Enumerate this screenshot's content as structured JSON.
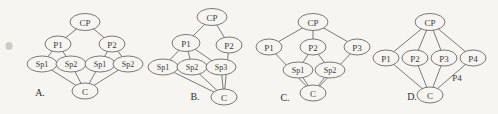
{
  "canvas": {
    "width": 498,
    "height": 114,
    "background": "#f6f5f2",
    "stroke_color": "#6b6b6b",
    "text_color": "#3a3a3a"
  },
  "figure": {
    "type": "diagram",
    "panels": [
      {
        "id": "A",
        "label": "A.",
        "label_x": 40,
        "label_y": 92,
        "nodes": [
          {
            "id": "a-cp",
            "label": "CP",
            "x": 85,
            "y": 22,
            "rx": 15,
            "ry": 8.5,
            "size": "cp"
          },
          {
            "id": "a-p1",
            "label": "P1",
            "x": 58,
            "y": 44,
            "rx": 13,
            "ry": 8,
            "size": "p"
          },
          {
            "id": "a-p2",
            "label": "P2",
            "x": 112,
            "y": 44,
            "rx": 13,
            "ry": 8,
            "size": "p"
          },
          {
            "id": "a-sp1",
            "label": "Sp1",
            "x": 42,
            "y": 64,
            "rx": 15,
            "ry": 8,
            "size": "sp"
          },
          {
            "id": "a-sp2",
            "label": "Sp2",
            "x": 71,
            "y": 64,
            "rx": 15,
            "ry": 8,
            "size": "sp"
          },
          {
            "id": "a-sp3",
            "label": "Sp1",
            "x": 100,
            "y": 64,
            "rx": 15,
            "ry": 8,
            "size": "sp"
          },
          {
            "id": "a-sp4",
            "label": "Sp2",
            "x": 128,
            "y": 64,
            "rx": 15,
            "ry": 8,
            "size": "sp"
          },
          {
            "id": "a-c",
            "label": "C",
            "x": 85,
            "y": 91,
            "rx": 13,
            "ry": 8,
            "size": "c"
          }
        ],
        "edges": [
          [
            "a-cp",
            "a-p1"
          ],
          [
            "a-cp",
            "a-p2"
          ],
          [
            "a-p1",
            "a-sp1"
          ],
          [
            "a-p1",
            "a-sp2"
          ],
          [
            "a-p2",
            "a-sp3"
          ],
          [
            "a-p2",
            "a-sp4"
          ],
          [
            "a-sp1",
            "a-c"
          ],
          [
            "a-sp2",
            "a-c"
          ],
          [
            "a-sp3",
            "a-c"
          ],
          [
            "a-sp4",
            "a-c"
          ]
        ]
      },
      {
        "id": "B",
        "label": "B.",
        "label_x": 195,
        "label_y": 96,
        "nodes": [
          {
            "id": "b-cp",
            "label": "CP",
            "x": 212,
            "y": 17,
            "rx": 15,
            "ry": 8.5,
            "size": "cp"
          },
          {
            "id": "b-p1",
            "label": "P1",
            "x": 186,
            "y": 43,
            "rx": 14,
            "ry": 8.5,
            "size": "p"
          },
          {
            "id": "b-p2",
            "label": "P2",
            "x": 229,
            "y": 45,
            "rx": 13,
            "ry": 8,
            "size": "p"
          },
          {
            "id": "b-sp1",
            "label": "Sp1",
            "x": 163,
            "y": 67,
            "rx": 15,
            "ry": 8,
            "size": "sp"
          },
          {
            "id": "b-sp2",
            "label": "Sp2",
            "x": 192,
            "y": 67,
            "rx": 15,
            "ry": 8,
            "size": "sp"
          },
          {
            "id": "b-sp3",
            "label": "Sp3",
            "x": 221,
            "y": 67,
            "rx": 15,
            "ry": 8,
            "size": "sp"
          },
          {
            "id": "b-c",
            "label": "C",
            "x": 224,
            "y": 97,
            "rx": 13,
            "ry": 8,
            "size": "c"
          }
        ],
        "edges": [
          [
            "b-cp",
            "b-p1"
          ],
          [
            "b-cp",
            "b-p2"
          ],
          [
            "b-p1",
            "b-sp1"
          ],
          [
            "b-p1",
            "b-sp2"
          ],
          [
            "b-p1",
            "b-sp3"
          ],
          [
            "b-sp1",
            "b-c"
          ],
          [
            "b-sp2",
            "b-c"
          ],
          [
            "b-sp3",
            "b-c"
          ],
          [
            "b-p2",
            "b-c"
          ]
        ]
      },
      {
        "id": "C",
        "label": "C.",
        "label_x": 285,
        "label_y": 97,
        "nodes": [
          {
            "id": "c-cp",
            "label": "CP",
            "x": 313,
            "y": 22,
            "rx": 15,
            "ry": 8.5,
            "size": "cp"
          },
          {
            "id": "c-p1",
            "label": "P1",
            "x": 269,
            "y": 47,
            "rx": 13,
            "ry": 8,
            "size": "p"
          },
          {
            "id": "c-p2",
            "label": "P2",
            "x": 313,
            "y": 47,
            "rx": 13,
            "ry": 8,
            "size": "p"
          },
          {
            "id": "c-p3",
            "label": "P3",
            "x": 357,
            "y": 47,
            "rx": 13,
            "ry": 8,
            "size": "p"
          },
          {
            "id": "c-sp1",
            "label": "Sp1",
            "x": 298,
            "y": 70,
            "rx": 15,
            "ry": 8,
            "size": "sp"
          },
          {
            "id": "c-sp2",
            "label": "Sp2",
            "x": 330,
            "y": 70,
            "rx": 15,
            "ry": 8,
            "size": "sp"
          },
          {
            "id": "c-c",
            "label": "C",
            "x": 313,
            "y": 93,
            "rx": 13,
            "ry": 8,
            "size": "c"
          }
        ],
        "edges": [
          [
            "c-cp",
            "c-p1"
          ],
          [
            "c-cp",
            "c-p2"
          ],
          [
            "c-cp",
            "c-p3"
          ],
          [
            "c-p2",
            "c-sp1"
          ],
          [
            "c-p2",
            "c-sp2"
          ],
          [
            "c-sp1",
            "c-c"
          ],
          [
            "c-sp2",
            "c-c"
          ],
          [
            "c-p1",
            "c-c"
          ],
          [
            "c-p3",
            "c-c"
          ]
        ]
      },
      {
        "id": "D",
        "label": "D.",
        "label_x": 412,
        "label_y": 96,
        "nodes": [
          {
            "id": "d-cp",
            "label": "CP",
            "x": 430,
            "y": 22,
            "rx": 15,
            "ry": 8.5,
            "size": "cp"
          },
          {
            "id": "d-p1",
            "label": "P1",
            "x": 386,
            "y": 58,
            "rx": 13,
            "ry": 8,
            "size": "p"
          },
          {
            "id": "d-p2",
            "label": "P2",
            "x": 415,
            "y": 58,
            "rx": 13,
            "ry": 8,
            "size": "p"
          },
          {
            "id": "d-p3",
            "label": "P3",
            "x": 444,
            "y": 58,
            "rx": 13,
            "ry": 8,
            "size": "p"
          },
          {
            "id": "d-p4",
            "label": "P4",
            "x": 473,
            "y": 58,
            "rx": 13,
            "ry": 8,
            "size": "p"
          },
          {
            "id": "d-c",
            "label": "C",
            "x": 430,
            "y": 95,
            "rx": 13,
            "ry": 8,
            "size": "c"
          }
        ],
        "edges": [
          [
            "d-cp",
            "d-p1"
          ],
          [
            "d-cp",
            "d-p2"
          ],
          [
            "d-cp",
            "d-p3"
          ],
          [
            "d-cp",
            "d-p4"
          ],
          [
            "d-p1",
            "d-c"
          ],
          [
            "d-p2",
            "d-c"
          ],
          [
            "d-p3",
            "d-c"
          ],
          [
            "d-p4",
            "d-c"
          ]
        ]
      }
    ],
    "stray_labels": [
      {
        "id": "stray-p4",
        "text": "P4",
        "x": 457,
        "y": 78
      }
    ],
    "specks": [
      {
        "id": "speck-left",
        "x": 9,
        "y": 46,
        "rx": 3.5,
        "ry": 4
      }
    ]
  }
}
